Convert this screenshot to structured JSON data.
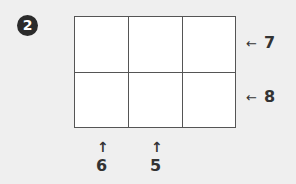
{
  "figure": {
    "step_number": "2",
    "grid": {
      "rows": 2,
      "columns": 3
    },
    "row_labels": [
      {
        "label": "7",
        "arrow": "←"
      },
      {
        "label": "8",
        "arrow": "←"
      }
    ],
    "column_labels": [
      {
        "label": "6",
        "arrow": "↑",
        "column": 1
      },
      {
        "label": "5",
        "arrow": "↑",
        "column": 2
      }
    ],
    "colors": {
      "background": "#efefef",
      "grid_line": "#555555",
      "cell": "#ffffff",
      "text": "#333333"
    }
  }
}
